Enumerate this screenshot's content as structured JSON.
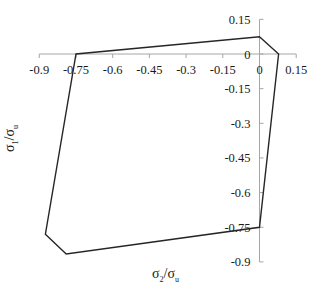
{
  "chart_data": {
    "type": "line",
    "title": "",
    "xlabel": "σ2/σu",
    "ylabel": "σ1/σu",
    "xlim": [
      -0.9,
      0.15
    ],
    "ylim": [
      -0.9,
      0.15
    ],
    "x_ticks": [
      -0.9,
      -0.75,
      -0.6,
      -0.45,
      -0.3,
      -0.15,
      0,
      0.15
    ],
    "y_ticks": [
      0.15,
      0,
      -0.15,
      -0.3,
      -0.45,
      -0.6,
      -0.75,
      -0.9
    ],
    "x_tick_labels": [
      "-0.9",
      "-0.75",
      "-0.6",
      "-0.45",
      "-0.3",
      "-0.15",
      "0",
      "0.15"
    ],
    "y_tick_labels": [
      "0.15",
      "0",
      "-0.15",
      "-0.3",
      "-0.45",
      "-0.6",
      "-0.75",
      "-0.9"
    ],
    "grid": false,
    "legend": null,
    "axes_cross_at_origin": true,
    "series": [
      {
        "name": "failure envelope",
        "closed": true,
        "color": "#262626",
        "points": [
          {
            "x": 0,
            "y": 0.075
          },
          {
            "x": 0.078,
            "y": 0
          },
          {
            "x": 0,
            "y": -0.75
          },
          {
            "x": -0.79,
            "y": -0.866
          },
          {
            "x": -0.875,
            "y": -0.78
          },
          {
            "x": -0.75,
            "y": 0
          }
        ]
      }
    ]
  },
  "labels": {
    "xlabel_main": "σ",
    "xlabel_sub1": "2",
    "xlabel_sep": "/σ",
    "xlabel_sub2": "u",
    "ylabel_main": "σ",
    "ylabel_sub1": "1",
    "ylabel_sep": "/σ",
    "ylabel_sub2": "u"
  },
  "colors": {
    "axis": "#a6a6a6",
    "line": "#262626",
    "text": "#1a1a1a"
  }
}
